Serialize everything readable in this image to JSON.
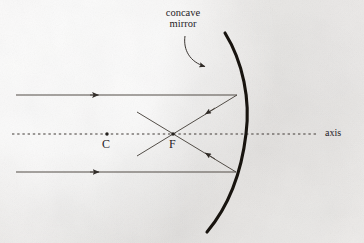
{
  "figure": {
    "background_color": "#f2f0ee",
    "ink_color": "#2b2724",
    "mirror_color": "#17130f"
  },
  "labels": {
    "caption_line1": "concave",
    "caption_line2": "mirror",
    "center_of_curvature": "C",
    "focal_point": "F",
    "axis": "axis"
  },
  "elements": {
    "mirror_name": "concave-mirror-arc",
    "axis_name": "principal-axis",
    "pointer_name": "caption-pointer-arrow",
    "incident_ray_upper": "incident-ray-upper",
    "incident_ray_lower": "incident-ray-lower",
    "reflected_ray_upper": "reflected-ray-upper",
    "reflected_ray_lower": "reflected-ray-lower"
  },
  "geometry": {
    "mirror_top": [
      225,
      33
    ],
    "mirror_vertex": [
      246,
      134
    ],
    "mirror_bottom": [
      207,
      232
    ],
    "axis_start_x": 12,
    "axis_end_x": 318,
    "axis_y": 134,
    "point_C": [
      107,
      134
    ],
    "point_F": [
      173,
      134
    ],
    "incident_upper_y": 95,
    "incident_lower_y": 172,
    "incident_start_x": 16,
    "mirror_hit_upper": [
      237,
      95
    ],
    "mirror_hit_lower": [
      236,
      172
    ]
  }
}
